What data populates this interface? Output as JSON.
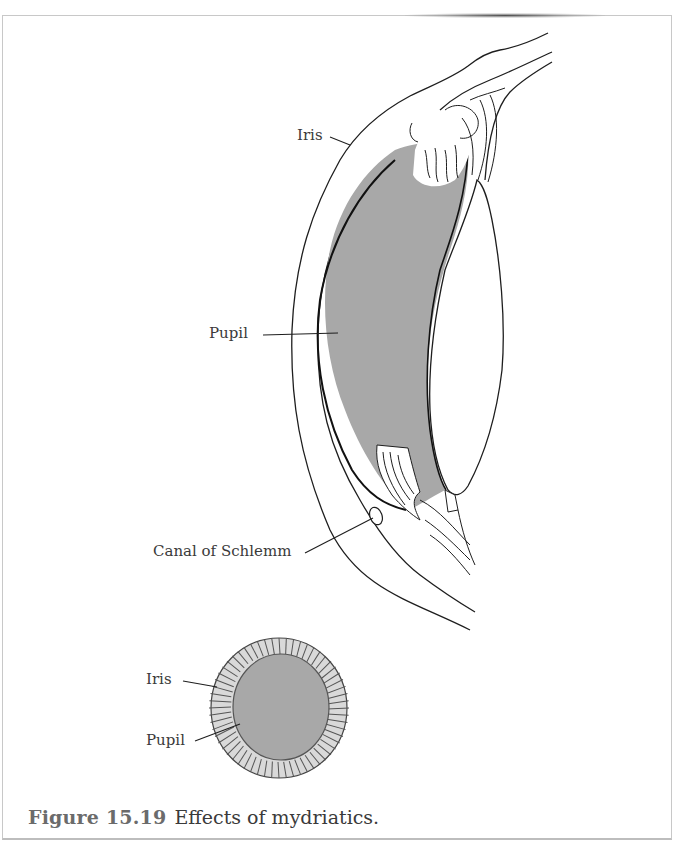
{
  "figure": {
    "number": "Figure 15.19",
    "title": "Effects of mydriatics."
  },
  "labels": {
    "side_view": {
      "iris": "Iris",
      "pupil": "Pupil",
      "canal_of_schlemm": "Canal of Schlemm"
    },
    "front_view": {
      "iris": "Iris",
      "pupil": "Pupil"
    }
  },
  "colors": {
    "pupil_fill": "#a8a8a8",
    "iris_ring_fill": "#d9d9d9",
    "line": "#1e1e1e",
    "caption_number": "#6b6b6b",
    "caption_text": "#3a3a3a",
    "frame_border": "#c8c8c8"
  }
}
